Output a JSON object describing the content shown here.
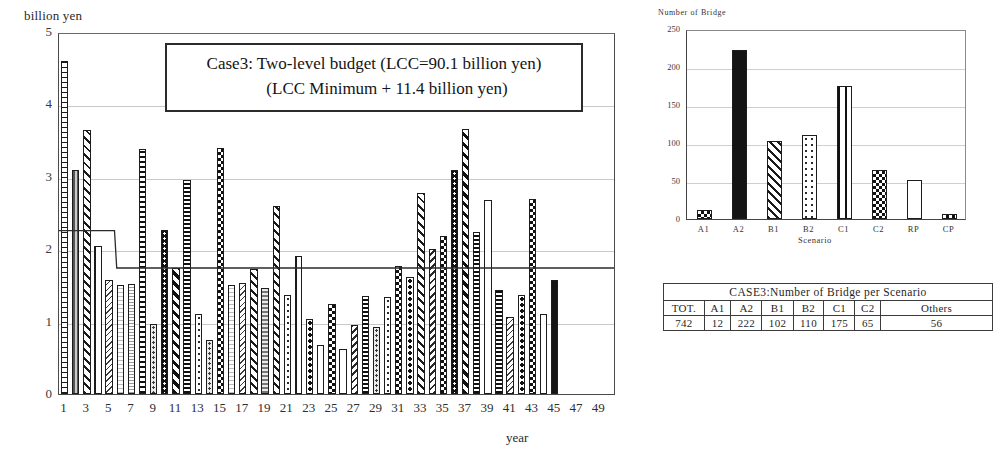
{
  "main": {
    "ylabel": "billion yen",
    "xlabel": "year",
    "title_line1": "Case3: Two-level budget (LCC=90.1 billion yen)",
    "title_line2": "(LCC Minimum + 11.4 billion yen)",
    "yticks": [
      "0",
      "1",
      "2",
      "3",
      "4",
      "5"
    ]
  },
  "scenario": {
    "ylabel": "Number of Bridge",
    "xlabel": "Scenario",
    "yticks": [
      "0",
      "50",
      "100",
      "150",
      "200",
      "250"
    ]
  },
  "table": {
    "caption": "CASE3:Number of Bridge per Scenario",
    "headers": [
      "TOT.",
      "A1",
      "A2",
      "B1",
      "B2",
      "C1",
      "C2",
      "Others"
    ],
    "values": [
      "742",
      "12",
      "222",
      "102",
      "110",
      "175",
      "65",
      "56"
    ]
  },
  "chart_data": [
    {
      "type": "bar",
      "title": "Case3: Two-level budget (LCC=90.1 billion yen) (LCC Minimum + 11.4 billion yen)",
      "xlabel": "year",
      "ylabel": "billion yen",
      "ylim": [
        0,
        5
      ],
      "grid": true,
      "xtick_labels": [
        "1",
        "3",
        "5",
        "7",
        "9",
        "11",
        "13",
        "15",
        "17",
        "19",
        "21",
        "23",
        "25",
        "27",
        "29",
        "31",
        "33",
        "35",
        "37",
        "39",
        "41",
        "43",
        "45",
        "47",
        "49"
      ],
      "categories": [
        1,
        2,
        3,
        4,
        5,
        6,
        7,
        8,
        9,
        10,
        11,
        12,
        13,
        14,
        15,
        16,
        17,
        18,
        19,
        20,
        21,
        22,
        23,
        24,
        25,
        26,
        27,
        28,
        29,
        30,
        31,
        32,
        33,
        34,
        35,
        36,
        37,
        38,
        39,
        40,
        41,
        42,
        43,
        44,
        45,
        46,
        47,
        48,
        49,
        50
      ],
      "values": [
        4.6,
        3.09,
        3.65,
        2.05,
        1.58,
        1.5,
        1.52,
        3.38,
        0.97,
        2.27,
        1.74,
        2.95,
        1.1,
        0.74,
        3.4,
        1.5,
        1.54,
        1.72,
        1.46,
        2.59,
        1.37,
        1.9,
        1.04,
        0.68,
        1.24,
        0.62,
        0.95,
        1.36,
        0.93,
        1.34,
        1.77,
        1.62,
        2.77,
        2.0,
        2.18,
        3.09,
        3.66,
        2.24,
        2.68,
        1.44,
        1.06,
        1.37,
        2.7,
        1.1,
        1.58
      ],
      "annotations": [
        {
          "name": "budget-step-line",
          "type": "step",
          "segments": [
            {
              "x_start": 1,
              "x_end": 5,
              "y": 2.27
            },
            {
              "x_start": 6,
              "x_end": 50,
              "y": 1.75
            }
          ]
        }
      ]
    },
    {
      "type": "bar",
      "title": "Number of Bridge per Scenario",
      "xlabel": "Scenario",
      "ylabel": "Number of Bridge",
      "ylim": [
        0,
        250
      ],
      "grid": true,
      "categories": [
        "A1",
        "A2",
        "B1",
        "B2",
        "C1",
        "C2",
        "RP",
        "CP"
      ],
      "values": [
        12,
        222,
        102,
        110,
        175,
        65,
        51,
        6
      ]
    },
    {
      "type": "table",
      "title": "CASE3:Number of Bridge per Scenario",
      "columns": [
        "TOT.",
        "A1",
        "A2",
        "B1",
        "B2",
        "C1",
        "C2",
        "Others"
      ],
      "rows": [
        [
          "742",
          "12",
          "222",
          "102",
          "110",
          "175",
          "65",
          "56"
        ]
      ]
    }
  ]
}
